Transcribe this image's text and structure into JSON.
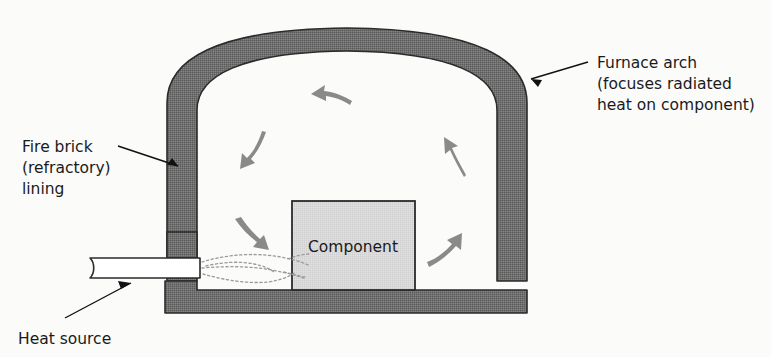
{
  "figure": {
    "name": "furnace-cross-section-diagram",
    "background_color": "#fbfbfa",
    "text_color": "#1a1a1a",
    "wall_fill_color": "#6e6e6e",
    "wall_outline_color": "#2b2b2b",
    "component_fill_color": "#d6d6d6",
    "component_outline_color": "#2b2b2b",
    "arrow_color": "#8a8a8a",
    "flame_color": "#9a9a9a",
    "burner_fill_color": "#ffffff"
  },
  "labels": {
    "fire_brick": {
      "line1": "Fire brick",
      "line2": "(refractory)",
      "line3": "lining"
    },
    "furnace_arch": {
      "line1": "Furnace arch",
      "line2": "(focuses radiated",
      "line3": "heat on component)"
    },
    "heat_source": {
      "line1": "Heat source"
    },
    "component": {
      "line1": "Component"
    }
  },
  "parts": {
    "furnace_arch": "furnace-arch",
    "left_wall": "left-refractory-wall",
    "right_wall": "right-refractory-wall",
    "floor": "furnace-floor",
    "component_block": "component-block",
    "burner_tube": "burner-tube",
    "flame_plume": "flame-plume"
  },
  "circulation_arrows": [
    {
      "name": "arrow-top-leftward",
      "direction": "left"
    },
    {
      "name": "arrow-upper-left-downward",
      "direction": "down-left"
    },
    {
      "name": "arrow-lower-left-downward",
      "direction": "down-right"
    },
    {
      "name": "arrow-right-upward",
      "direction": "up-left"
    },
    {
      "name": "arrow-lower-right-upward",
      "direction": "up-right"
    }
  ]
}
